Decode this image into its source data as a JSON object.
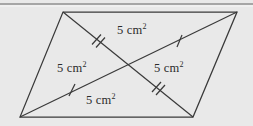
{
  "figure": {
    "background_color": "#e9e9e9",
    "stroke_color": "#3a3a3a",
    "text_color": "#2b2b2b",
    "top_rule": {
      "present": true,
      "color": "#8a8a8a",
      "y": 4
    },
    "shape": {
      "type": "parallelogram",
      "vertices": {
        "top_left": [
          63,
          12
        ],
        "top_right": [
          237,
          12
        ],
        "bottom_right": [
          193,
          117
        ],
        "bottom_left": [
          20,
          117
        ]
      },
      "diagonals": [
        {
          "name": "diagonal-tl-br",
          "from": [
            63,
            12
          ],
          "to": [
            193,
            117
          ]
        },
        {
          "name": "diagonal-bl-tr",
          "from": [
            20,
            117
          ],
          "to": [
            237,
            12
          ]
        }
      ],
      "intersection": [
        128,
        64
      ]
    },
    "tick_marks": [
      {
        "name": "tick-upper-left-segment",
        "count": 2,
        "on": "diagonal-tl-br",
        "position": [
          98,
          43
        ]
      },
      {
        "name": "tick-upper-right-segment",
        "count": 1,
        "on": "diagonal-bl-tr",
        "position": [
          180,
          42
        ]
      },
      {
        "name": "tick-lower-left-segment",
        "count": 1,
        "on": "diagonal-bl-tr",
        "position": [
          72,
          90
        ]
      },
      {
        "name": "tick-lower-right-segment",
        "count": 2,
        "on": "diagonal-tl-br",
        "position": [
          158,
          88
        ]
      }
    ],
    "labels": {
      "top": {
        "value": "5 cm",
        "exponent": "2"
      },
      "left": {
        "value": "5 cm",
        "exponent": "2"
      },
      "right": {
        "value": "5 cm",
        "exponent": "2"
      },
      "bottom": {
        "value": "5 cm",
        "exponent": "2"
      }
    }
  }
}
